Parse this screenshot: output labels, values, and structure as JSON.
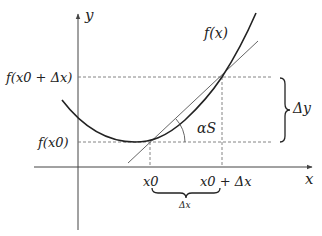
{
  "diagram": {
    "axes": {
      "x_label": "x",
      "y_label": "y"
    },
    "curve_label": "f(x)",
    "y_ticks": {
      "upper": "f(x0 + Δx)",
      "lower": "f(x0)"
    },
    "x_ticks": {
      "left": "x0",
      "right": "x0 + Δx"
    },
    "delta_y_label": "Δy",
    "delta_x_label": "Δx",
    "angle_label": "αS",
    "colors": {
      "line": "#222222",
      "secant": "#555555",
      "dashed": "#777777",
      "background": "#ffffff"
    }
  }
}
